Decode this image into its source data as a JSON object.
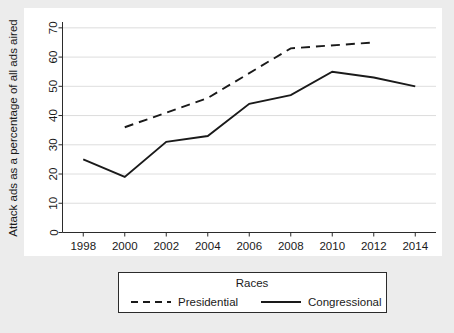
{
  "chart_data": {
    "type": "line",
    "title": "",
    "xlabel": "",
    "ylabel": "Attack ads as a percentage of all ads aired",
    "x": [
      1998,
      2000,
      2002,
      2004,
      2006,
      2008,
      2010,
      2012,
      2014
    ],
    "xtick_labels": [
      "1998",
      "2000",
      "2002",
      "2004",
      "2006",
      "2008",
      "2010",
      "2012",
      "2014"
    ],
    "ytick_labels": [
      "0",
      "10",
      "20",
      "30",
      "40",
      "50",
      "60",
      "70"
    ],
    "yticks": [
      0,
      10,
      20,
      30,
      40,
      50,
      60,
      70
    ],
    "xlim": [
      1997,
      2015
    ],
    "ylim": [
      0,
      72
    ],
    "grid": "horizontal",
    "legend_position": "below-plot",
    "legend_title": "Races",
    "series": [
      {
        "name": "Presidential",
        "style": "dashed",
        "color": "#1a1a1a",
        "x": [
          2000,
          2004,
          2008,
          2012
        ],
        "values": [
          36,
          46,
          63,
          65
        ]
      },
      {
        "name": "Congressional",
        "style": "solid",
        "color": "#1a1a1a",
        "x": [
          1998,
          2000,
          2002,
          2004,
          2006,
          2008,
          2010,
          2012,
          2014
        ],
        "values": [
          25,
          19,
          31,
          33,
          44,
          47,
          55,
          53,
          50
        ]
      }
    ]
  },
  "colors": {
    "page_background": "#ececec",
    "panel_background": "#ffffff",
    "axis": "#2b2b2b",
    "gridline": "#d9d9d9",
    "line": "#1a1a1a"
  }
}
